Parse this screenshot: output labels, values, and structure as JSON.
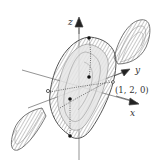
{
  "diagram": {
    "type": "3d-surface-plot",
    "axes": {
      "x_label": "x",
      "y_label": "y",
      "z_label": "z"
    },
    "point_label": "(1, 2, 0)",
    "colors": {
      "surface_stroke": "#6a6a6a",
      "surface_fill": "#d9d9d9",
      "axis": "#555555",
      "dot": "#111111"
    }
  }
}
